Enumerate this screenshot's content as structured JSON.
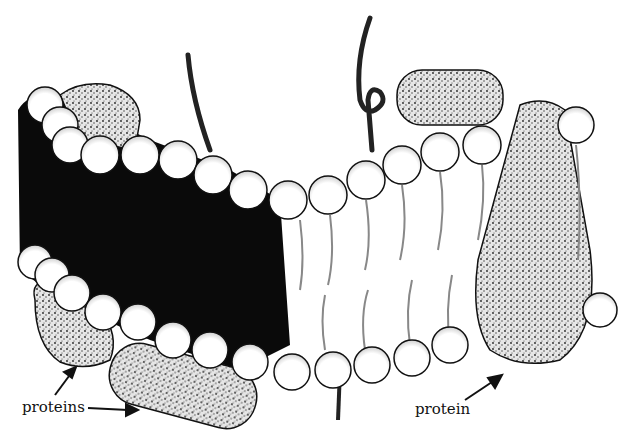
{
  "diagram": {
    "labels": {
      "proteins": "proteins",
      "protein": "protein"
    },
    "colors": {
      "ink": "#111111",
      "background": "#ffffff",
      "protein_fill": "#bdbdbd"
    }
  }
}
